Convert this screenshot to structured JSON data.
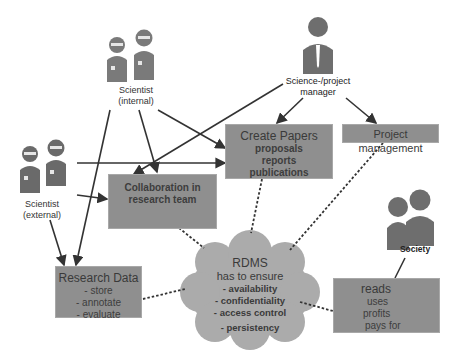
{
  "diagram": {
    "actors": {
      "scientist_internal": {
        "label_line1": "Scientist",
        "label_line2": "(internal)"
      },
      "scientist_external": {
        "label_line1": "Scientist",
        "label_line2": "(external)"
      },
      "manager": {
        "label_line1": "Science-/project",
        "label_line2": "manager"
      },
      "society": {
        "label": "Society"
      }
    },
    "boxes": {
      "create_papers": {
        "title": "Create Papers",
        "items": [
          "proposals",
          "reports",
          "publications"
        ]
      },
      "project_management": {
        "title": "Project management"
      },
      "collaboration": {
        "title_line1": "Collaboration in",
        "title_line2": "research team"
      },
      "research_data": {
        "title": "Research Data",
        "items": [
          "- store",
          "- annotate",
          "- evaluate"
        ]
      },
      "society_box": {
        "items": [
          "reads",
          "uses",
          "profits",
          "pays for"
        ]
      }
    },
    "cloud": {
      "title": "RDMS",
      "subtitle": "has to ensure",
      "items": [
        "- availability",
        "- confidentiality",
        "- access control",
        "- persistency"
      ]
    },
    "colors": {
      "box_fill": "#8f8f8f",
      "cloud_fill": "#a9a9a9",
      "figure_fill": "#6e6e6e",
      "connector": "#333333"
    }
  }
}
